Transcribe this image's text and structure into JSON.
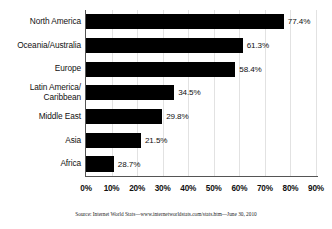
{
  "chart_data": {
    "type": "bar",
    "orientation": "horizontal",
    "title": "",
    "subtitle": "",
    "xlabel": "",
    "ylabel": "",
    "xlim": [
      0,
      90
    ],
    "xtick_step": 10,
    "grid": true,
    "legend": "none",
    "bar_color": "#000000",
    "background_color": "#ffffff",
    "gridline_color": "#e2e2e2",
    "axis_color": "#555555",
    "categories": [
      "North America",
      "Oceania/Australia",
      "Europe",
      "Latin America/\nCaribbean",
      "Middle East",
      "Asia",
      "Africa"
    ],
    "values": [
      77.4,
      61.3,
      58.4,
      34.5,
      29.8,
      21.5,
      28.7
    ],
    "plotted_values": [
      77.4,
      61.3,
      58.4,
      34.5,
      29.8,
      21.5,
      10.9
    ],
    "data_labels": [
      "77.4%",
      "61.3%",
      "58.4%",
      "34.5%",
      "29.8%",
      "21.5%",
      "28.7%"
    ],
    "xticklabels": [
      "0%",
      "10%",
      "20%",
      "30%",
      "40%",
      "50%",
      "60%",
      "70%",
      "80%",
      "90%"
    ],
    "xtickvalues": [
      0,
      10,
      20,
      30,
      40,
      50,
      60,
      70,
      80,
      90
    ],
    "annotations": []
  },
  "source": {
    "text": "Source: Internet World Stats—www.internetworldstats.com/stats.htm—June 30, 2010"
  }
}
